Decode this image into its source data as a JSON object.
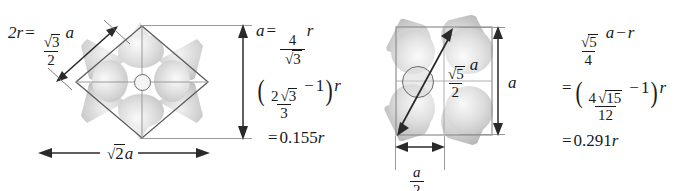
{
  "figure": {
    "background": "#ffffff",
    "ink": "#1a1a1a",
    "sphere_light": "#efefef",
    "sphere_mid": "#cfcfcf",
    "sphere_dark": "#a9a9a9",
    "cell_line_color": "#9a9a9a",
    "arrow_color": "#2a2a2a"
  },
  "panels": [
    {
      "id": "bcc-110-plane",
      "name": "body-centered-cubic-110-plane",
      "labels": {
        "edge_relation": {
          "lhs": "2r",
          "equals": "=",
          "frac_num": "3",
          "frac_num_radical": "√",
          "frac_den": "2",
          "trailing_var": "a",
          "plain": "2r = (√3/2)a"
        },
        "horizontal_dimension": {
          "radical": "√",
          "radicand": "2",
          "var": "a",
          "plain": "√2 a"
        },
        "vertical_dimension": {
          "var": "a",
          "plain": "a"
        }
      },
      "results": [
        {
          "lhs": "a",
          "equals": "=",
          "frac_num": "4",
          "frac_den_radical": "√",
          "frac_den": "3",
          "trailing": "r",
          "plain": "a = 4/√3 r"
        },
        {
          "open": "(",
          "frac_num_coef": "2",
          "frac_num_radical": "√",
          "frac_num_radicand": "3",
          "frac_den": "3",
          "minus": "−",
          "one": "1",
          "close": ")",
          "trailing": "r",
          "plain": "(2√3/3 − 1) r"
        },
        {
          "equals": "=",
          "value": "0.155",
          "unit": "r",
          "plain": "= 0.155 r"
        }
      ]
    },
    {
      "id": "fcc-100-plane",
      "name": "face-centered-cubic-100-plane",
      "labels": {
        "diagonal_relation": {
          "frac_num_radical": "√",
          "frac_num": "5",
          "frac_den": "2",
          "trailing_var": "a",
          "plain": "(√5/2) a"
        },
        "vertical_dimension": {
          "var": "a",
          "plain": "a"
        },
        "horizontal_dimension": {
          "frac_num": "a",
          "frac_den": "2",
          "plain": "a/2"
        }
      },
      "results": [
        {
          "frac_num_radical": "√",
          "frac_num": "5",
          "frac_den": "4",
          "var": "a",
          "minus": "−",
          "trailing": "r",
          "plain": "√5/4 a − r"
        },
        {
          "equals": "=",
          "open": "(",
          "frac_num_coef": "4",
          "frac_num_radical": "√",
          "frac_num_radicand": "15",
          "frac_den": "12",
          "minus": "−",
          "one": "1",
          "close": ")",
          "trailing": "r",
          "plain": "= (4√15/12 − 1) r"
        },
        {
          "equals": "=",
          "value": "0.291",
          "unit": "r",
          "plain": "= 0.291 r"
        }
      ]
    }
  ]
}
